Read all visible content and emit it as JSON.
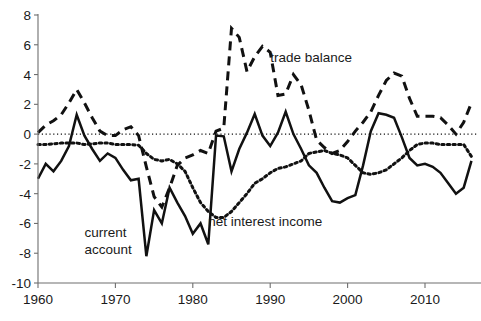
{
  "chart_data": {
    "type": "line",
    "title": "",
    "subtitle": "",
    "xlabel": "",
    "ylabel": "",
    "xlim": [
      1960,
      2016
    ],
    "ylim": [
      -10,
      8
    ],
    "yticks": [
      8,
      6,
      4,
      2,
      0,
      -2,
      -4,
      -6,
      -8,
      -10
    ],
    "ytick_labels": [
      "8",
      "6",
      "4",
      "2",
      "0",
      "-2",
      "-4",
      "-6",
      "-8",
      "-10"
    ],
    "xticks": [
      1960,
      1970,
      1980,
      1990,
      2000,
      2010
    ],
    "xtick_labels": [
      "1960",
      "1970",
      "1980",
      "1990",
      "2000",
      "2010"
    ],
    "grid": false,
    "zero_reference_line": 0,
    "legend_position": "inline-annotations",
    "annotations": [
      {
        "text": "trade balance",
        "x": 1990,
        "y": 4.85
      },
      {
        "text": "net interest income",
        "x": 1982,
        "y": -6.2
      },
      {
        "text": "current account",
        "x": 1966,
        "y": -6.9
      }
    ],
    "x": [
      1960,
      1961,
      1962,
      1963,
      1964,
      1965,
      1966,
      1967,
      1968,
      1969,
      1970,
      1971,
      1972,
      1973,
      1974,
      1975,
      1976,
      1977,
      1978,
      1979,
      1980,
      1981,
      1982,
      1983,
      1984,
      1985,
      1986,
      1987,
      1988,
      1989,
      1990,
      1991,
      1992,
      1993,
      1994,
      1995,
      1996,
      1997,
      1998,
      1999,
      2000,
      2001,
      2002,
      2003,
      2004,
      2005,
      2006,
      2007,
      2008,
      2009,
      2010,
      2011,
      2012,
      2013,
      2014,
      2015,
      2016
    ],
    "series": [
      {
        "name": "current account",
        "style": "solid",
        "values": [
          -3.0,
          -2.0,
          -2.5,
          -1.8,
          -0.8,
          1.3,
          -0.1,
          -1.0,
          -1.8,
          -1.3,
          -1.6,
          -2.4,
          -3.1,
          -3.0,
          -8.2,
          -5.1,
          -6.0,
          -3.6,
          -4.6,
          -5.5,
          -6.7,
          -6.0,
          -7.4,
          -0.1,
          -0.15,
          -2.5,
          -1.0,
          0.1,
          1.35,
          -0.1,
          -0.8,
          0.1,
          1.5,
          0.0,
          -1.0,
          -2.1,
          -2.6,
          -3.6,
          -4.5,
          -4.6,
          -4.3,
          -4.1,
          -2.1,
          0.2,
          1.4,
          1.3,
          1.1,
          -0.2,
          -1.6,
          -2.1,
          -2.0,
          -2.2,
          -2.6,
          -3.3,
          -4.0,
          -3.6,
          -1.8
        ]
      },
      {
        "name": "trade balance",
        "style": "dashed",
        "values": [
          0.1,
          0.6,
          0.9,
          1.3,
          2.1,
          3.0,
          2.1,
          1.1,
          0.2,
          -0.1,
          -0.1,
          0.3,
          0.5,
          -0.1,
          -2.2,
          -4.2,
          -4.9,
          -3.6,
          -2.1,
          -1.6,
          -1.4,
          -1.1,
          -1.3,
          0.2,
          0.4,
          7.1,
          6.5,
          4.2,
          5.2,
          5.9,
          5.5,
          2.6,
          2.7,
          4.0,
          3.3,
          1.6,
          -0.4,
          -0.9,
          -1.3,
          -1.1,
          -0.5,
          0.2,
          0.8,
          1.5,
          2.6,
          3.6,
          4.1,
          3.9,
          2.4,
          1.2,
          1.2,
          1.2,
          1.1,
          0.6,
          0.0,
          0.8,
          2.1
        ]
      },
      {
        "name": "net interest income",
        "style": "dotted",
        "values": [
          -0.7,
          -0.7,
          -0.65,
          -0.6,
          -0.6,
          -0.6,
          -0.7,
          -0.65,
          -0.6,
          -0.6,
          -0.7,
          -0.7,
          -0.7,
          -0.75,
          -1.3,
          -1.7,
          -1.8,
          -1.7,
          -2.0,
          -2.5,
          -3.6,
          -4.6,
          -5.2,
          -5.6,
          -5.6,
          -5.2,
          -4.6,
          -4.0,
          -3.3,
          -3.0,
          -2.6,
          -2.3,
          -2.2,
          -2.0,
          -1.8,
          -1.3,
          -1.2,
          -1.1,
          -1.3,
          -1.4,
          -1.6,
          -2.1,
          -2.6,
          -2.7,
          -2.6,
          -2.4,
          -2.0,
          -1.6,
          -1.1,
          -0.7,
          -0.6,
          -0.6,
          -0.7,
          -0.7,
          -0.7,
          -0.7,
          -1.5
        ]
      }
    ]
  },
  "axes": {
    "y_axis_name": "value-axis",
    "x_axis_name": "year-axis"
  }
}
